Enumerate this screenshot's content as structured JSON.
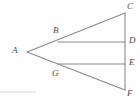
{
  "figure": {
    "background_color": "#fefefe",
    "stroke_color": "#8a8a8a",
    "label_color": "#4a4a4a",
    "stroke_width": 1.1,
    "width": 140,
    "height": 98
  },
  "points": [
    {
      "name": "A",
      "label": "A",
      "x": 27,
      "y": 52,
      "label_x": 12,
      "label_y": 46
    },
    {
      "name": "B",
      "label": "B",
      "x": 58,
      "y": 42,
      "label_x": 53,
      "label_y": 26
    },
    {
      "name": "C",
      "label": "C",
      "x": 125,
      "y": 13,
      "label_x": 127,
      "label_y": 2
    },
    {
      "name": "D",
      "label": "D",
      "x": 125,
      "y": 42,
      "label_x": 129,
      "label_y": 36
    },
    {
      "name": "E",
      "label": "E",
      "x": 125,
      "y": 64,
      "label_x": 129,
      "label_y": 58
    },
    {
      "name": "F",
      "label": "F",
      "x": 125,
      "y": 90,
      "label_x": 127,
      "label_y": 89
    },
    {
      "name": "G",
      "label": "G",
      "x": 58,
      "y": 64,
      "label_x": 52,
      "label_y": 69
    }
  ],
  "segments": [
    {
      "name": "segment-AC",
      "from": "A",
      "to": "C"
    },
    {
      "name": "segment-AF",
      "from": "A",
      "to": "F"
    },
    {
      "name": "segment-CF",
      "from": "C",
      "to": "F"
    },
    {
      "name": "segment-BD",
      "from": "B",
      "to": "D"
    },
    {
      "name": "segment-GE",
      "from": "G",
      "to": "E"
    }
  ],
  "artifact": {
    "name": "scan-line",
    "x1": 0,
    "y1": 92,
    "x2": 36,
    "y2": 92,
    "color": "#d6d6d6"
  },
  "labels": {
    "A": "A",
    "B": "B",
    "C": "C",
    "D": "D",
    "E": "E",
    "F": "F",
    "G": "G"
  }
}
